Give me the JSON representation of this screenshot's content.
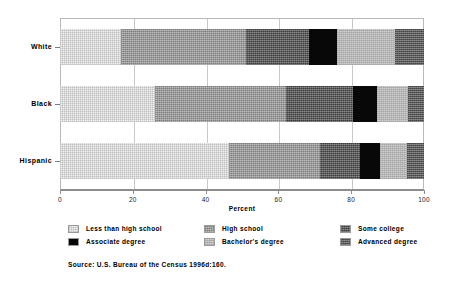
{
  "chart_data": {
    "type": "bar",
    "orientation": "horizontal",
    "stacked": true,
    "normalized": true,
    "title": "",
    "xlabel": "Percent",
    "ylabel": "",
    "xlim": [
      0,
      100
    ],
    "xticks": [
      0,
      20,
      40,
      60,
      80,
      100
    ],
    "xtick_labels": [
      "0",
      "20",
      "40",
      "60",
      "80",
      "100"
    ],
    "grid": true,
    "legend_position": "below",
    "categories": [
      "White",
      "Black",
      "Hispanic"
    ],
    "series": [
      {
        "name": "Less than high school",
        "values": [
          16.8,
          26.0,
          46.4
        ],
        "fill": "f0"
      },
      {
        "name": "High school",
        "values": [
          34.2,
          36.0,
          25.0
        ],
        "fill": "f1"
      },
      {
        "name": "Some college",
        "values": [
          17.4,
          18.5,
          11.0
        ],
        "fill": "f2"
      },
      {
        "name": "Associate degree",
        "values": [
          7.6,
          6.5,
          5.6
        ],
        "fill": "f3"
      },
      {
        "name": "Bachelor's degree",
        "values": [
          16.0,
          8.5,
          7.4
        ],
        "fill": "f4"
      },
      {
        "name": "Advanced degree",
        "values": [
          8.0,
          4.5,
          4.6
        ],
        "fill": "f5"
      }
    ],
    "source": "Source: U.S. Bureau of the Census 1996d:160."
  },
  "legend": {
    "rows": [
      [
        {
          "label": "Less than high school",
          "fill": "f0"
        },
        {
          "label": "High school",
          "fill": "f1"
        },
        {
          "label": "Some college",
          "fill": "f2"
        }
      ],
      [
        {
          "label": "Associate degree",
          "fill": "f3"
        },
        {
          "label": "Bachelor's degree",
          "fill": "f4"
        },
        {
          "label": "Advanced degree",
          "fill": "f5"
        }
      ]
    ]
  },
  "colors": {
    "axis": "#8d8d8d",
    "grid": "#c9c9c9",
    "text": "#000000",
    "background": "#ffffff"
  }
}
